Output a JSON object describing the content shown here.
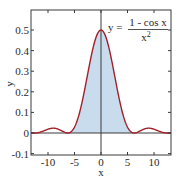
{
  "chart_data": {
    "type": "line",
    "title": "",
    "annotation": {
      "lhs": "y =",
      "numerator": "1 - cos x",
      "denominator": "x",
      "denominator_exp": "2"
    },
    "xlabel": "x",
    "ylabel": "y",
    "xlim": [
      -13.2,
      13.2
    ],
    "ylim": [
      -0.1,
      0.6
    ],
    "grid": false,
    "legend": "none",
    "x_ticks": [
      -10,
      -5,
      0,
      5,
      10
    ],
    "x_tick_labels": [
      "-10",
      "-5",
      "0",
      "5",
      "10"
    ],
    "y_ticks": [
      -0.1,
      0,
      0.1,
      0.2,
      0.3,
      0.4,
      0.5
    ],
    "y_tick_labels": [
      "-0.1",
      "0",
      "0.1",
      "0.2",
      "0.3",
      "0.4",
      "0.5"
    ],
    "shaded_region": {
      "x_from": -6.2832,
      "x_to": 6.2832,
      "description": "area under main lobe"
    },
    "series": [
      {
        "name": "y = (1 - cos x) / x^2",
        "x": [
          -13.2,
          -13,
          -12,
          -11,
          -10,
          -9,
          -8,
          -7,
          -6.2832,
          -6,
          -5,
          -4,
          -3,
          -2,
          -1,
          0,
          1,
          2,
          3,
          4,
          5,
          6,
          6.2832,
          7,
          8,
          9,
          10,
          11,
          12,
          13,
          13.2
        ],
        "y": [
          0.007,
          0.00536,
          0.00108,
          0.00832,
          0.01839,
          0.0236,
          0.0179,
          0.00507,
          0,
          0.0011,
          0.0287,
          0.1029,
          0.2211,
          0.354,
          0.4597,
          0.5,
          0.4597,
          0.354,
          0.2211,
          0.1029,
          0.0287,
          0.0011,
          0,
          0.00507,
          0.0179,
          0.0236,
          0.01839,
          0.00832,
          0.00108,
          0.00536,
          0.007
        ]
      }
    ],
    "colors": {
      "curve": "#a3202a",
      "fill": "#c9dcee",
      "axis": "#3a3a3a",
      "frame": "#3a3a3a"
    }
  }
}
